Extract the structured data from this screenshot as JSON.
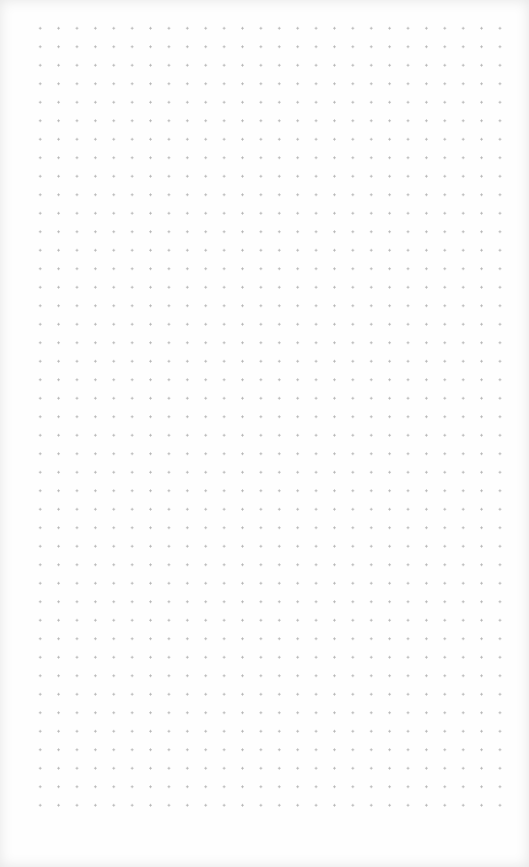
{
  "page": {
    "type": "dot-grid-paper",
    "background_color": "#fefefe",
    "dot_color": "#b4b4b4",
    "grid": {
      "columns": 27,
      "rows": 44,
      "spacing_x": 18.4,
      "spacing_y": 18.5
    }
  }
}
